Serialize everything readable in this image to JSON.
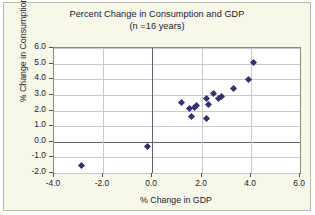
{
  "chart_data": {
    "type": "scatter",
    "title": "Percent Change in Consumption and GDP",
    "subtitle": "(n =16 years)",
    "xlabel": "% Change in GDP",
    "ylabel": "% Change in Consumption",
    "xlim": [
      -4.0,
      6.0
    ],
    "ylim": [
      -2.0,
      6.0
    ],
    "xticks": [
      "-4.0",
      "-2.0",
      "0.0",
      "2.0",
      "4.0",
      "6.0"
    ],
    "xtick_values": [
      -4.0,
      -2.0,
      0.0,
      2.0,
      4.0,
      6.0
    ],
    "yticks": [
      "6.0",
      "5.0",
      "4.0",
      "3.0",
      "2.0",
      "1.0",
      "0.0",
      "-1.0",
      "-2.0"
    ],
    "ytick_values": [
      6.0,
      5.0,
      4.0,
      3.0,
      2.0,
      1.0,
      0.0,
      -1.0,
      -2.0
    ],
    "grid": true,
    "legend": false,
    "marker": "diamond",
    "marker_color": "#33336e",
    "n_points": 16,
    "points": [
      {
        "x": -2.9,
        "y": -1.5
      },
      {
        "x": -0.2,
        "y": -0.3
      },
      {
        "x": 1.2,
        "y": 2.5
      },
      {
        "x": 1.5,
        "y": 2.1
      },
      {
        "x": 1.6,
        "y": 1.6
      },
      {
        "x": 1.7,
        "y": 2.2
      },
      {
        "x": 1.8,
        "y": 2.3
      },
      {
        "x": 2.2,
        "y": 2.8
      },
      {
        "x": 2.2,
        "y": 1.5
      },
      {
        "x": 2.3,
        "y": 2.4
      },
      {
        "x": 2.5,
        "y": 3.1
      },
      {
        "x": 2.7,
        "y": 2.8
      },
      {
        "x": 2.8,
        "y": 2.9
      },
      {
        "x": 3.3,
        "y": 3.4
      },
      {
        "x": 3.9,
        "y": 4.0
      },
      {
        "x": 4.1,
        "y": 5.1
      }
    ]
  },
  "colors": {
    "figure_background": "#f7f7ea",
    "plot_background": "#ffffff",
    "marker": "#33336e",
    "gridline": "#c9c9d2",
    "axis_line": "#62626e",
    "text": "#1b1b2e"
  }
}
